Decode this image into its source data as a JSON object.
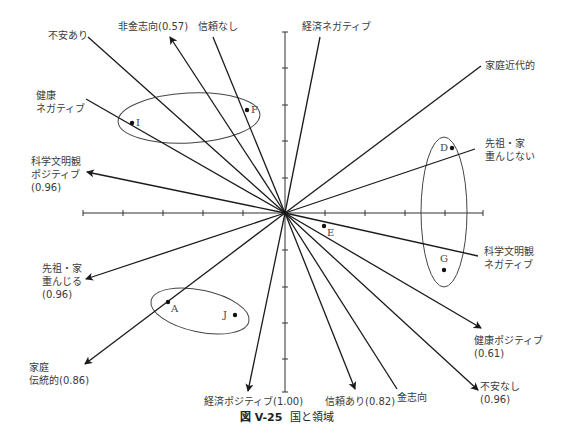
{
  "figure": {
    "caption_number": "図 V-25",
    "caption_title": "国と領域"
  },
  "axes": {
    "center": [
      285,
      213
    ],
    "horizontal_ticks": [
      83,
      123,
      163,
      203,
      243,
      285,
      325,
      365,
      405,
      445,
      483
    ],
    "vertical_ticks": [
      32,
      68,
      105,
      141,
      178,
      213,
      250,
      287,
      323,
      359,
      392
    ]
  },
  "vectors": [
    {
      "id": "fuan-ari",
      "label": "不安あり",
      "end": [
        88,
        37
      ],
      "arrow": false
    },
    {
      "id": "hikin-shiko",
      "label": "非金志向(0.57)",
      "end": [
        170,
        37
      ],
      "arrow": true
    },
    {
      "id": "shinrai-nashi",
      "label": "信頼なし",
      "end": [
        213,
        37
      ],
      "arrow": false
    },
    {
      "id": "keizai-negative",
      "label": "経済ネガティブ",
      "end": [
        320,
        37
      ],
      "arrow": false
    },
    {
      "id": "katei-kindaiteki",
      "label": "家庭近代的",
      "end": [
        481,
        66
      ],
      "arrow": false
    },
    {
      "id": "senzo-omonjinai",
      "label": "先祖・家 重んじない",
      "end": [
        475,
        149
      ],
      "arrow": false
    },
    {
      "id": "kenko-negative",
      "label": "健康 ネガティブ",
      "end": [
        86,
        99
      ],
      "arrow": false
    },
    {
      "id": "kagaku-positive",
      "label": "科学文明観 ポジティブ (0.96)",
      "end": [
        87,
        172
      ],
      "arrow": true
    },
    {
      "id": "kagaku-negative",
      "label": "科学文明観 ネガティブ",
      "end": [
        478,
        256
      ],
      "arrow": false
    },
    {
      "id": "senzo-omonjiru",
      "label": "先祖・家 重んじる (0.96)",
      "end": [
        86,
        279
      ],
      "arrow": true
    },
    {
      "id": "katei-dentoteki",
      "label": "家庭 伝統的(0.86)",
      "end": [
        85,
        364
      ],
      "arrow": true
    },
    {
      "id": "keizai-positive",
      "label": "経済ポジティブ(1.00)",
      "end": [
        248,
        391
      ],
      "arrow": true
    },
    {
      "id": "shinrai-ari",
      "label": "信頼あり(0.82)",
      "end": [
        355,
        389
      ],
      "arrow": true
    },
    {
      "id": "kin-shiko",
      "label": "金志向",
      "end": [
        397,
        389
      ],
      "arrow": false
    },
    {
      "id": "kenko-positive",
      "label": "健康ポジティブ (0.61)",
      "end": [
        481,
        328
      ],
      "arrow": true
    },
    {
      "id": "fuan-nashi",
      "label": "不安なし (0.96)",
      "end": [
        478,
        390
      ],
      "arrow": true
    }
  ],
  "labels": {
    "fuan_ari": "不安あり",
    "hikin_shiko": "非金志向(0.57)",
    "shinrai_nashi": "信頼なし",
    "keizai_negative": "経済ネガティブ",
    "katei_kindaiteki": "家庭近代的",
    "senzo_omonjinai_1": "先祖・家",
    "senzo_omonjinai_2": "重んじない",
    "kenko_negative_1": "健康",
    "kenko_negative_2": "ネガティブ",
    "kagaku_positive_1": "科学文明観",
    "kagaku_positive_2": "ポジティブ",
    "kagaku_positive_3": "(0.96)",
    "kagaku_negative_1": "科学文明観",
    "kagaku_negative_2": "ネガティブ",
    "senzo_omonjiru_1": "先祖・家",
    "senzo_omonjiru_2": "重んじる",
    "senzo_omonjiru_3": "(0.96)",
    "katei_dentoteki_1": "家庭",
    "katei_dentoteki_2": "伝統的(0.86)",
    "keizai_positive": "経済ポジティブ(1.00)",
    "shinrai_ari": "信頼あり(0.82)",
    "kin_shiko": "金志向",
    "kenko_positive_1": "健康ポジティブ",
    "kenko_positive_2": "(0.61)",
    "fuan_nashi_1": "不安なし",
    "fuan_nashi_2": "(0.96)"
  },
  "points": [
    {
      "label": "A",
      "x": 168,
      "y": 302
    },
    {
      "label": "D",
      "x": 452,
      "y": 148
    },
    {
      "label": "E",
      "x": 324,
      "y": 226
    },
    {
      "label": "F",
      "x": 247,
      "y": 110
    },
    {
      "label": "G",
      "x": 444,
      "y": 270
    },
    {
      "label": "I",
      "x": 132,
      "y": 123
    },
    {
      "label": "J",
      "x": 235,
      "y": 315
    }
  ],
  "clusters": [
    {
      "name": "I-F",
      "cx": 189,
      "cy": 118,
      "rx": 71,
      "ry": 25,
      "rotate": -3
    },
    {
      "name": "A-J",
      "cx": 200,
      "cy": 311,
      "rx": 50,
      "ry": 21,
      "rotate": 12
    },
    {
      "name": "D-G",
      "cx": 444,
      "cy": 212,
      "rx": 23,
      "ry": 75,
      "rotate": 0
    }
  ],
  "colors": {
    "line": "#1a1a1a",
    "axis": "#333333",
    "text": "#3a3a3a"
  }
}
